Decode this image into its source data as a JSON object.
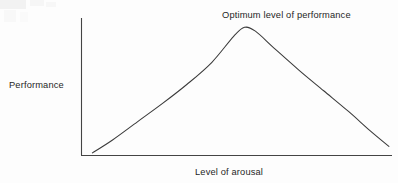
{
  "chart_data": {
    "type": "line",
    "title": "",
    "xlabel": "Level of arousal",
    "ylabel": "Performance",
    "annotations": [
      {
        "text": "Optimum level of performance",
        "points_to": "curve-peak"
      }
    ],
    "grid": false,
    "legend": false,
    "axis_ticks": [],
    "xlim": [
      0,
      100
    ],
    "ylim": [
      0,
      100
    ],
    "series": [
      {
        "name": "Performance vs arousal",
        "x": [
          3.5,
          10,
          18,
          26,
          34,
          42,
          49,
          52.5,
          56,
          62,
          70,
          78,
          86,
          93,
          99
        ],
        "y": [
          2,
          12,
          26,
          40,
          55,
          72,
          92,
          99,
          96,
          83,
          66,
          50,
          34,
          19,
          7
        ],
        "color": "#3a3a3a"
      }
    ]
  },
  "labels": {
    "y_axis": "Performance",
    "x_axis": "Level of arousal",
    "peak_annotation": "Optimum level of performance"
  },
  "colors": {
    "background": "#fdfdfd",
    "axis": "#444444",
    "curve": "#3a3a3a",
    "text": "#262626"
  }
}
